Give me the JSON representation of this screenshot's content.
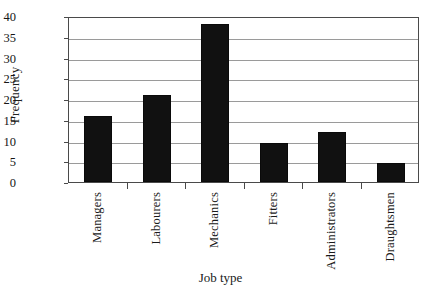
{
  "chart_data": {
    "type": "bar",
    "title": "",
    "xlabel": "Job type",
    "ylabel": "Frequency",
    "categories": [
      "Managers",
      "Labourers",
      "Mechanics",
      "Fitters",
      "Administrators",
      "Draughtsmen"
    ],
    "values": [
      16,
      21,
      38,
      9.5,
      12,
      4.5
    ],
    "ylim": [
      0,
      40
    ],
    "yticks": [
      0,
      5,
      10,
      15,
      20,
      25,
      30,
      35,
      40
    ],
    "ytick_labels": [
      "0",
      "5",
      "10",
      "15",
      "20",
      "25",
      "30",
      "35",
      "40"
    ],
    "grid": "horizontal",
    "legend": "none",
    "bar_color": "#111111",
    "gridline_color": "#9a9a9a",
    "frame_color": "#4a4a4a",
    "background_color": "#ffffff"
  }
}
